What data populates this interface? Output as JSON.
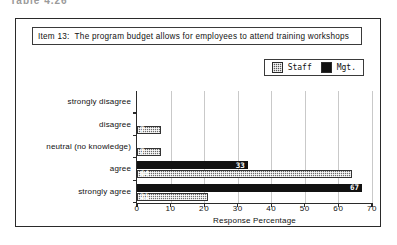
{
  "page_header": "Table 4.26",
  "figure": {
    "item_label": "Item 13:",
    "item_text": "The program budget allows for employees to attend training workshops"
  },
  "legend": {
    "entries": [
      {
        "name": "staff",
        "label": "Staff",
        "swatch": "hatched-gray-square",
        "color": "#6b6b6b"
      },
      {
        "name": "mgt",
        "label": "Mgt.",
        "swatch": "solid-black-square",
        "color": "#111111"
      }
    ]
  },
  "chart_data": {
    "type": "bar",
    "orientation": "horizontal",
    "title": "Item 13:  The program budget allows for employees to attend training workshops",
    "xlabel": "Response Percentage",
    "ylabel": "",
    "xlim": [
      0,
      70
    ],
    "xticks": [
      0,
      10,
      20,
      30,
      40,
      50,
      60,
      70
    ],
    "grid": true,
    "legend_position": "top-right",
    "categories": [
      "strongly disagree",
      "disagree",
      "neutral (no knowledge)",
      "agree",
      "strongly agree"
    ],
    "series": [
      {
        "name": "Mgt.",
        "color": "#111111",
        "values": [
          0,
          0,
          0,
          33,
          67
        ]
      },
      {
        "name": "Staff",
        "color": "#6b6b6b",
        "values": [
          0,
          7,
          7,
          64,
          21
        ]
      }
    ],
    "data_labels": {
      "Mgt.": [
        "",
        "",
        "",
        "33",
        "67"
      ],
      "Staff": [
        "",
        "7",
        "7",
        "64",
        "21"
      ]
    }
  }
}
